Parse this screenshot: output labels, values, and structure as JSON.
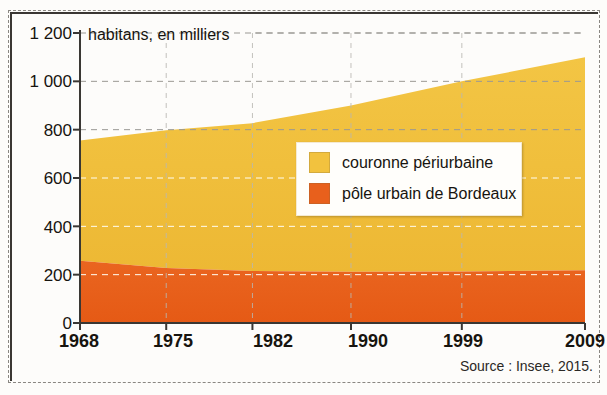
{
  "chart_data": {
    "type": "area",
    "title": "",
    "subtitle": "",
    "axis_note": "habitans, en milliers",
    "xlabel": "",
    "ylabel": "habitans, en milliers",
    "x": [
      1968,
      1975,
      1982,
      1990,
      1999,
      2009
    ],
    "tick_labels_x": [
      "1968",
      "1975",
      "1982",
      "1990",
      "1999",
      "2009"
    ],
    "tick_labels_y": [
      "0",
      "200",
      "400",
      "600",
      "800",
      "1 000",
      "1 200"
    ],
    "ticks_y": [
      0,
      200,
      400,
      600,
      800,
      1000,
      1200
    ],
    "ylim": [
      0,
      1200
    ],
    "xlim": [
      1968,
      2009
    ],
    "grid": true,
    "stacked": true,
    "legend_position": "center",
    "series": [
      {
        "name": "pôle urbain de Bordeaux",
        "color": "#e8601c",
        "values": [
          258,
          228,
          215,
          212,
          213,
          218
        ]
      },
      {
        "name": "couronne périurbaine",
        "color": "#f2c23e",
        "values": [
          497,
          570,
          612,
          688,
          787,
          882
        ]
      }
    ],
    "totals": [
      755,
      798,
      827,
      900,
      1000,
      1100
    ],
    "source": "Source : Insee, 2015."
  },
  "legend": {
    "items": [
      {
        "label": "couronne périurbaine",
        "color": "#f2c23e"
      },
      {
        "label": "pôle urbain de Bordeaux",
        "color": "#e8601c"
      }
    ]
  },
  "axes": {
    "unit_label": "habitans, en milliers",
    "y_labels": [
      "1 200",
      "1 000",
      "800",
      "600",
      "400",
      "200",
      "0"
    ],
    "x_labels": [
      "1968",
      "1975",
      "1982",
      "1990",
      "1999",
      "2009"
    ]
  },
  "footer": {
    "source": "Source : Insee, 2015."
  }
}
